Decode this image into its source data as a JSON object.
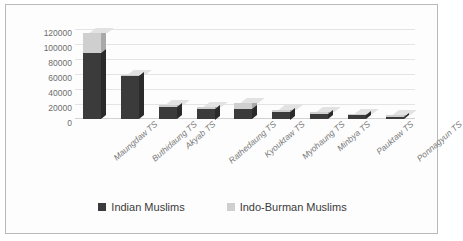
{
  "chart_data": {
    "type": "bar",
    "subtype": "stacked-3d-column",
    "title": "",
    "xlabel": "",
    "ylabel": "",
    "ylim": [
      0,
      120000
    ],
    "yticks": [
      0,
      20000,
      40000,
      60000,
      80000,
      100000,
      120000
    ],
    "ytick_labels": [
      "0",
      "20000",
      "40000",
      "60000",
      "80000",
      "100000",
      "120000"
    ],
    "grid": true,
    "legend_position": "bottom",
    "categories": [
      "Maungdaw TS",
      "Buthidaung TS",
      "Akyab TS",
      "Rathedaung TS",
      "Kyouktaw TS",
      "Myohaung TS",
      "Minbya TS",
      "Pauktaw TS",
      "Ponnagyun TS"
    ],
    "series": [
      {
        "name": "Indian Muslims",
        "color": "#3b3b3b",
        "values": [
          88000,
          57000,
          16000,
          14000,
          13000,
          10000,
          7000,
          5000,
          3000
        ]
      },
      {
        "name": "Indo-Burman Muslims",
        "color": "#cfcfcf",
        "values": [
          27000,
          1500,
          3000,
          1500,
          9000,
          1000,
          800,
          700,
          500
        ]
      }
    ],
    "totals": [
      115000,
      58500,
      19000,
      15500,
      22000,
      11000,
      7800,
      5700,
      3500
    ]
  },
  "legend": {
    "items": [
      {
        "label": "Indian Muslims",
        "color": "#3b3b3b"
      },
      {
        "label": "Indo-Burman Muslims",
        "color": "#cfcfcf"
      }
    ]
  }
}
